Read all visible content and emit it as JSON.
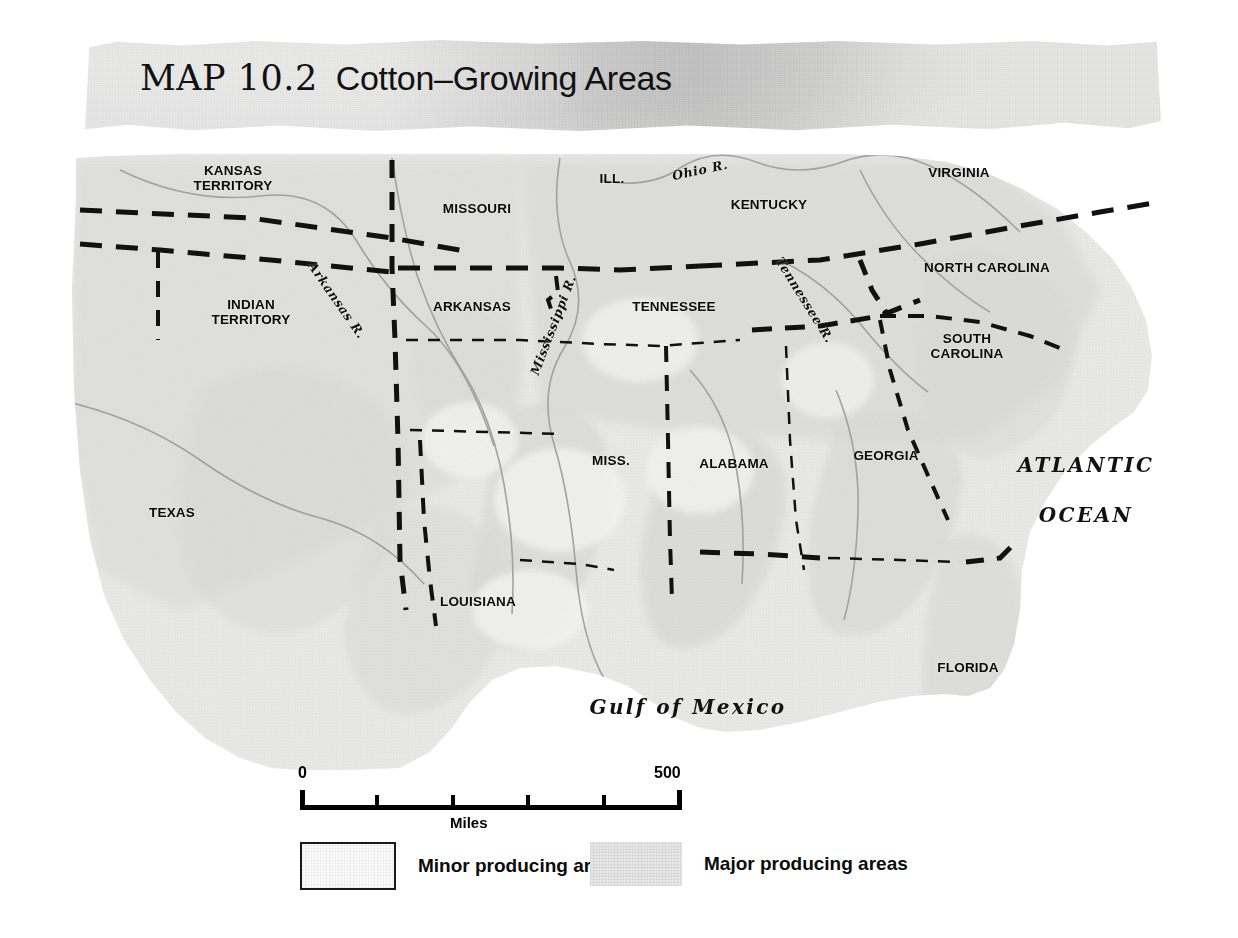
{
  "title": {
    "lead": "MAP 10.2",
    "subject": "Cotton–Growing Areas"
  },
  "map": {
    "places": [
      {
        "name": "KANSAS TERRITORY",
        "label": "KANSAS\nTERRITORY",
        "x": 233,
        "y": 38
      },
      {
        "name": "INDIAN TERRITORY",
        "label": "INDIAN\nTERRITORY",
        "x": 251,
        "y": 172
      },
      {
        "name": "MISSOURI",
        "label": "MISSOURI",
        "x": 477,
        "y": 68
      },
      {
        "name": "ILL.",
        "label": "ILL.",
        "x": 612,
        "y": 38
      },
      {
        "name": "KENTUCKY",
        "label": "KENTUCKY",
        "x": 769,
        "y": 64
      },
      {
        "name": "VIRGINIA",
        "label": "VIRGINIA",
        "x": 959,
        "y": 32
      },
      {
        "name": "ARKANSAS",
        "label": "ARKANSAS",
        "x": 472,
        "y": 166
      },
      {
        "name": "TENNESSEE",
        "label": "TENNESSEE",
        "x": 674,
        "y": 166
      },
      {
        "name": "NORTH CAROLINA",
        "label": "NORTH CAROLINA",
        "x": 987,
        "y": 127
      },
      {
        "name": "SOUTH CAROLINA",
        "label": "SOUTH\nCAROLINA",
        "x": 967,
        "y": 206
      },
      {
        "name": "MISS.",
        "label": "MISS.",
        "x": 611,
        "y": 320
      },
      {
        "name": "ALABAMA",
        "label": "ALABAMA",
        "x": 734,
        "y": 323
      },
      {
        "name": "GEORGIA",
        "label": "GEORGIA",
        "x": 886,
        "y": 315
      },
      {
        "name": "TEXAS",
        "label": "TEXAS",
        "x": 172,
        "y": 372
      },
      {
        "name": "LOUISIANA",
        "label": "LOUISIANA",
        "x": 478,
        "y": 461
      },
      {
        "name": "FLORIDA",
        "label": "FLORIDA",
        "x": 968,
        "y": 527
      }
    ],
    "rivers": [
      {
        "name": "Arkansas R.",
        "label": "Arkansas R.",
        "x": 337,
        "y": 160,
        "rot": 55
      },
      {
        "name": "Mississippi R.",
        "label": "Mississippi R.",
        "x": 553,
        "y": 185,
        "rot": -69
      },
      {
        "name": "Ohio R.",
        "label": "Ohio R.",
        "x": 700,
        "y": 30,
        "rot": -12
      },
      {
        "name": "Tennessee R.",
        "label": "Tennessee R.",
        "x": 805,
        "y": 160,
        "rot": 58
      }
    ],
    "oceans": [
      {
        "name": "Atlantic Ocean",
        "line1": "ATLANTIC",
        "line2": "OCEAN",
        "x": 1086,
        "y": 350
      },
      {
        "name": "Gulf of Mexico",
        "line1": "Gulf of Mexico",
        "x": 688,
        "y": 567
      }
    ]
  },
  "scale": {
    "min_label": "0",
    "max_label": "500",
    "unit_label": "Miles",
    "segments": 5
  },
  "legend": {
    "items": [
      {
        "key": "minor",
        "label": "Minor producing areas",
        "fill": "#fafafa",
        "bordered": true
      },
      {
        "key": "major",
        "label": "Major producing areas",
        "fill": "#e7e7e7",
        "bordered": false
      }
    ]
  },
  "colors": {
    "paper": "#ffffff",
    "banner": "#d2d2d0",
    "land_base": "#d0d0ce",
    "minor_area": "#f4f4f2",
    "major_area": "#c4c4c2",
    "border_dash": "#111111",
    "river_line": "#9a9a98",
    "text": "#0a0a0a"
  }
}
